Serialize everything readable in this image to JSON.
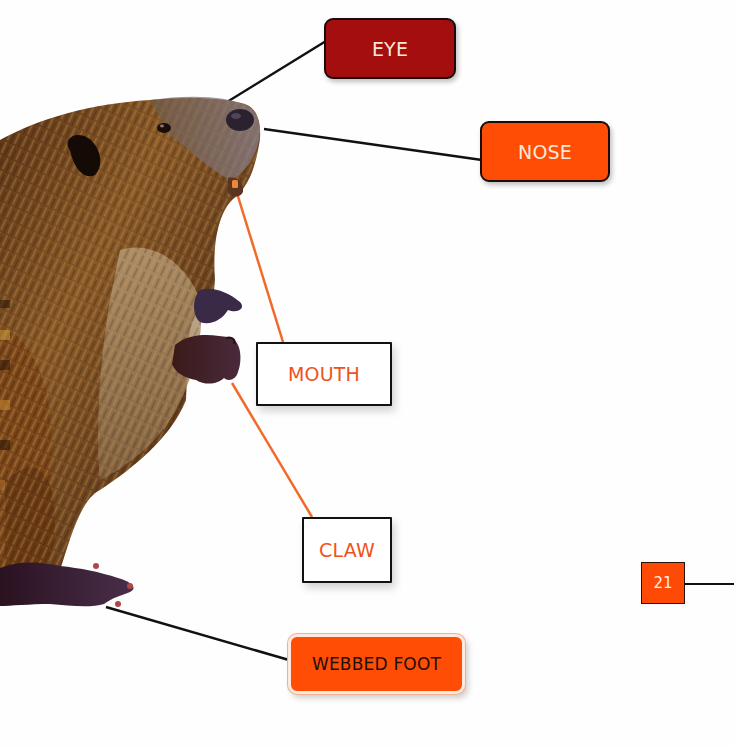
{
  "diagram": {
    "labels": {
      "eye": "EYE",
      "nose": "NOSE",
      "mouth": "MOUTH",
      "claw": "CLAW",
      "webbed_foot": "WEBBED FOOT"
    },
    "page_number": "21",
    "colors": {
      "dark_red": "#a50e0e",
      "orange": "#ff4d06",
      "orange_text": "#f0521a",
      "leader_black": "#111111",
      "leader_orange": "#f26a2a"
    }
  }
}
